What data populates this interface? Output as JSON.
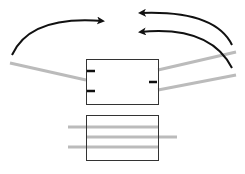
{
  "diagram": {
    "width": 245,
    "height": 174,
    "colors": {
      "background": "#ffffff",
      "box_stroke": "#333333",
      "connector": "#bbbbbb",
      "arrow": "#111111",
      "pin": "#111111"
    },
    "top_component": {
      "box": {
        "x": 86,
        "y": 59,
        "w": 72,
        "h": 45
      },
      "pins": [
        {
          "x1": 87,
          "y1": 71,
          "x2": 95,
          "y2": 71
        },
        {
          "x1": 87,
          "y1": 91,
          "x2": 95,
          "y2": 91
        },
        {
          "x1": 149,
          "y1": 82,
          "x2": 157,
          "y2": 82
        }
      ],
      "connectors": [
        {
          "x1": 10,
          "y1": 63,
          "x2": 86,
          "y2": 80
        },
        {
          "x1": 158,
          "y1": 70,
          "x2": 236,
          "y2": 52
        },
        {
          "x1": 158,
          "y1": 90,
          "x2": 236,
          "y2": 75
        }
      ]
    },
    "bottom_component": {
      "box": {
        "x": 86,
        "y": 115,
        "w": 72,
        "h": 45
      },
      "lines": [
        {
          "x1": 68,
          "y1": 127,
          "x2": 158,
          "y2": 127
        },
        {
          "x1": 86,
          "y1": 137,
          "x2": 177,
          "y2": 137
        },
        {
          "x1": 68,
          "y1": 147,
          "x2": 158,
          "y2": 147
        }
      ]
    },
    "arrows": [
      {
        "path": "M 12 55 Q 30 15 103 21",
        "direction": "right"
      },
      {
        "path": "M 232 45 Q 215 10 140 13",
        "direction": "left"
      },
      {
        "path": "M 232 68 Q 210 25 140 32",
        "direction": "left"
      }
    ]
  }
}
